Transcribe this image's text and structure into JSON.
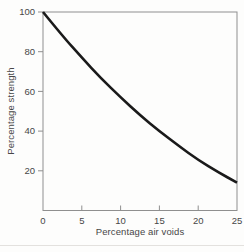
{
  "figure": {
    "background": "#fdfdfc",
    "axis_color": "#8f8f8f",
    "tick_color": "#8f8f8f",
    "text_color": "#474747",
    "curve_color": "#1a1a1a"
  },
  "chart_data": {
    "type": "line",
    "title": "",
    "xlabel": "Percentage air voids",
    "ylabel": "Percentage strength",
    "xlim": [
      0,
      25
    ],
    "ylim": [
      0,
      100
    ],
    "grid": false,
    "legend": null,
    "x_tick_labels": [
      0,
      5,
      10,
      15,
      20,
      25
    ],
    "x_tick_marks": [
      5,
      10,
      15,
      20
    ],
    "y_tick_labels": [
      20,
      40,
      60,
      80,
      100
    ],
    "y_tick_marks": [
      20,
      40,
      60,
      80,
      100
    ],
    "series": [
      {
        "name": "strength-vs-air-voids",
        "x": [
          0,
          2.5,
          5,
          7.5,
          10,
          12.5,
          15,
          17.5,
          20,
          22.5,
          25
        ],
        "y": [
          100,
          88,
          77,
          66.5,
          57,
          48,
          40,
          32.5,
          25.5,
          19.5,
          14
        ]
      }
    ]
  }
}
